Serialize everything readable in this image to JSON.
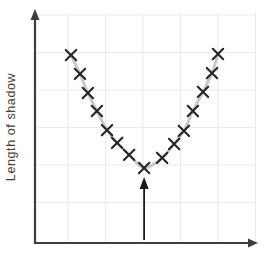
{
  "chart_data": {
    "type": "scatter",
    "title": "",
    "xlabel": "",
    "ylabel": "Length of shadow",
    "marker": "x",
    "grid": true,
    "legend": false,
    "axis_ticks": "none (unlabeled axes)",
    "x_units_note": "grid cells right of y-axis",
    "y_units_note": "grid cells above x-axis",
    "points": [
      [
        0.96,
        5.01
      ],
      [
        1.2,
        4.51
      ],
      [
        1.41,
        4.0
      ],
      [
        1.65,
        3.52
      ],
      [
        1.92,
        3.01
      ],
      [
        2.19,
        2.67
      ],
      [
        2.51,
        2.35
      ],
      [
        2.91,
        2.0
      ],
      [
        3.39,
        2.27
      ],
      [
        3.71,
        2.64
      ],
      [
        3.97,
        2.99
      ],
      [
        4.21,
        3.52
      ],
      [
        4.48,
        4.03
      ],
      [
        4.72,
        4.53
      ],
      [
        4.88,
        5.04
      ]
    ],
    "annotation": {
      "type": "arrow",
      "points_to": "minimum-point",
      "x": 2.91,
      "y_from": 0.08,
      "y_to": 1.76
    },
    "colors": {
      "background": "#ffffff",
      "grid": "#eaeaea",
      "curve": "#c6c6c6",
      "marker": "#262626",
      "axis": "#3d3d3d",
      "arrow": "#1a1a1a",
      "label": "#3f3f3f"
    }
  }
}
